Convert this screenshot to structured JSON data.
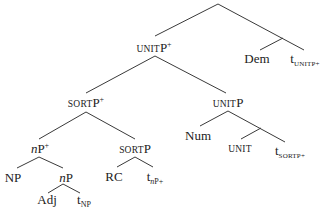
{
  "diagram": {
    "type": "syntax-tree",
    "nodes": {
      "unitp_plus": {
        "base": "UNIT",
        "head": "P",
        "sup": "+"
      },
      "dem": {
        "text": "Dem"
      },
      "t_unitp_plus": {
        "t": "t",
        "sub": "UNITP+"
      },
      "sortp_plus": {
        "base": "SORT",
        "head": "P",
        "sup": "+"
      },
      "unitp": {
        "base": "UNIT",
        "head": "P"
      },
      "np_plus": {
        "ital": "n",
        "head": "P",
        "sup": "+"
      },
      "sortp": {
        "base": "SORT",
        "head": "P"
      },
      "num": {
        "text": "Num"
      },
      "unit": {
        "text": "UNIT"
      },
      "t_sortp_plus": {
        "t": "t",
        "sub": "SORTP+"
      },
      "NP": {
        "text": "NP"
      },
      "np": {
        "ital": "n",
        "head": "P"
      },
      "rc": {
        "text": "RC"
      },
      "t_np_plus": {
        "t": "t",
        "subital": "n",
        "sub": "P+"
      },
      "adj": {
        "text": "Adj"
      },
      "t_NP": {
        "t": "t",
        "sub": "NP"
      }
    }
  }
}
